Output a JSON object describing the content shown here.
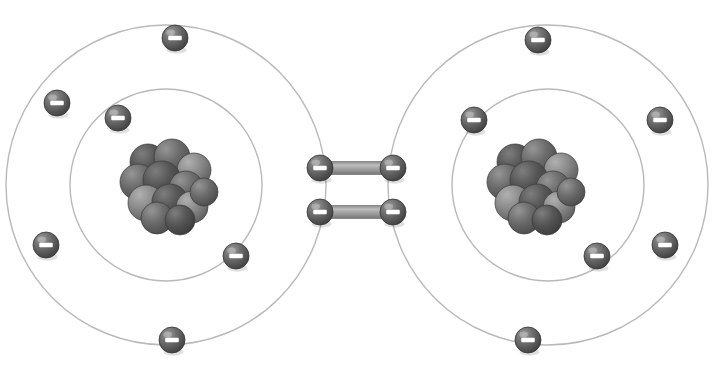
{
  "diagram": {
    "type": "atomic-bohr-model",
    "background_color": "#ffffff",
    "molecule_label": "double covalent bond",
    "bond_order": 2,
    "atom_count": 2,
    "shared_electron_count": 4,
    "colors": {
      "electron_fill_dark": "#4a4a4a",
      "electron_fill_mid": "#6e6e6e",
      "electron_highlight": "#9a9a9a",
      "electron_sign": "#ffffff",
      "orbit_line": "#b9b9b9",
      "nucleon_dark": "#4b4b4b",
      "nucleon_mid": "#6a6a6a",
      "nucleon_light": "#8d8d8d",
      "bond_bar": "#9e9e9e",
      "bond_bar_edge": "#7a7a7a",
      "background": "#ffffff"
    },
    "electron_sign": "−",
    "electron_radius": 13,
    "nucleon_radius": 17,
    "atoms": [
      {
        "name": "left-atom",
        "nucleus": {
          "name": "left-nucleus",
          "center_x": 166,
          "center_y": 185,
          "nucleon_count": 12,
          "nucleons": [
            {
              "x": 148,
              "y": 162,
              "r": 18,
              "shade": "dark"
            },
            {
              "x": 172,
              "y": 157,
              "r": 18,
              "shade": "mid"
            },
            {
              "x": 194,
              "y": 170,
              "r": 17,
              "shade": "light"
            },
            {
              "x": 138,
              "y": 182,
              "r": 18,
              "shade": "mid"
            },
            {
              "x": 162,
              "y": 180,
              "r": 19,
              "shade": "dark"
            },
            {
              "x": 186,
              "y": 188,
              "r": 17,
              "shade": "mid"
            },
            {
              "x": 146,
              "y": 203,
              "r": 18,
              "shade": "light"
            },
            {
              "x": 170,
              "y": 202,
              "r": 18,
              "shade": "dark"
            },
            {
              "x": 192,
              "y": 207,
              "r": 16,
              "shade": "light"
            },
            {
              "x": 157,
              "y": 218,
              "r": 16,
              "shade": "mid"
            },
            {
              "x": 180,
              "y": 220,
              "r": 15,
              "shade": "dark"
            },
            {
              "x": 204,
              "y": 192,
              "r": 14,
              "shade": "mid"
            }
          ]
        },
        "shells": [
          {
            "name": "left-inner-shell",
            "shell_index": 1,
            "center_x": 166,
            "center_y": 185,
            "radius": 96,
            "electron_count": 2,
            "electrons": [
              {
                "name": "left-inner-electron-upper-left",
                "x": 118,
                "y": 118
              },
              {
                "name": "left-inner-electron-lower-right",
                "x": 236,
                "y": 256
              }
            ]
          },
          {
            "name": "left-outer-shell",
            "shell_index": 2,
            "center_x": 166,
            "center_y": 185,
            "radius": 160,
            "electron_count": 4,
            "electrons": [
              {
                "name": "left-outer-electron-top",
                "x": 175,
                "y": 38
              },
              {
                "name": "left-outer-electron-upper-left",
                "x": 57,
                "y": 103
              },
              {
                "name": "left-outer-electron-lower-left",
                "x": 46,
                "y": 245
              },
              {
                "name": "left-outer-electron-bottom",
                "x": 172,
                "y": 340
              }
            ]
          }
        ]
      },
      {
        "name": "right-atom",
        "nucleus": {
          "name": "right-nucleus",
          "center_x": 533,
          "center_y": 185,
          "nucleon_count": 12,
          "nucleons": [
            {
              "x": 515,
              "y": 162,
              "r": 18,
              "shade": "dark"
            },
            {
              "x": 539,
              "y": 157,
              "r": 18,
              "shade": "mid"
            },
            {
              "x": 561,
              "y": 170,
              "r": 17,
              "shade": "light"
            },
            {
              "x": 505,
              "y": 182,
              "r": 18,
              "shade": "mid"
            },
            {
              "x": 529,
              "y": 180,
              "r": 19,
              "shade": "dark"
            },
            {
              "x": 553,
              "y": 188,
              "r": 17,
              "shade": "mid"
            },
            {
              "x": 513,
              "y": 203,
              "r": 18,
              "shade": "light"
            },
            {
              "x": 537,
              "y": 202,
              "r": 18,
              "shade": "dark"
            },
            {
              "x": 559,
              "y": 207,
              "r": 16,
              "shade": "light"
            },
            {
              "x": 524,
              "y": 218,
              "r": 16,
              "shade": "mid"
            },
            {
              "x": 547,
              "y": 220,
              "r": 15,
              "shade": "dark"
            },
            {
              "x": 571,
              "y": 192,
              "r": 14,
              "shade": "mid"
            }
          ]
        },
        "shells": [
          {
            "name": "right-inner-shell",
            "shell_index": 1,
            "center_x": 548,
            "center_y": 185,
            "radius": 96,
            "electron_count": 2,
            "electrons": [
              {
                "name": "right-inner-electron-upper-left",
                "x": 474,
                "y": 120
              },
              {
                "name": "right-inner-electron-lower-right",
                "x": 597,
                "y": 256
              }
            ]
          },
          {
            "name": "right-outer-shell",
            "shell_index": 2,
            "center_x": 548,
            "center_y": 185,
            "radius": 160,
            "electron_count": 4,
            "electrons": [
              {
                "name": "right-outer-electron-top",
                "x": 538,
                "y": 40
              },
              {
                "name": "right-outer-electron-right",
                "x": 660,
                "y": 120
              },
              {
                "name": "right-outer-electron-lower-right",
                "x": 665,
                "y": 245
              },
              {
                "name": "right-outer-electron-bottom",
                "x": 528,
                "y": 340
              }
            ]
          }
        ]
      }
    ],
    "bonds": [
      {
        "name": "upper-bond",
        "bond_index": 1,
        "bar": {
          "x1": 320,
          "y1": 168,
          "x2": 393,
          "y2": 168,
          "thickness": 13
        },
        "electrons": [
          {
            "name": "upper-bond-electron-left",
            "x": 320,
            "y": 168
          },
          {
            "name": "upper-bond-electron-right",
            "x": 393,
            "y": 168
          }
        ]
      },
      {
        "name": "lower-bond",
        "bond_index": 2,
        "bar": {
          "x1": 320,
          "y1": 212,
          "x2": 393,
          "y2": 212,
          "thickness": 13
        },
        "electrons": [
          {
            "name": "lower-bond-electron-left",
            "x": 320,
            "y": 212
          },
          {
            "name": "lower-bond-electron-right",
            "x": 393,
            "y": 212
          }
        ]
      }
    ]
  }
}
